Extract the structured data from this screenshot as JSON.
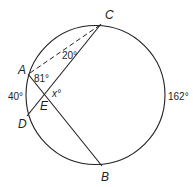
{
  "diagram": {
    "points": {
      "A": "A",
      "B": "B",
      "C": "C",
      "D": "D",
      "E": "E"
    },
    "angles": {
      "angle_A": "81°",
      "angle_C": "20°",
      "angle_E": "x°"
    },
    "arcs": {
      "arc_AD": "40°",
      "arc_CB": "162°"
    },
    "colors": {
      "stroke": "#231f20",
      "background": "#ffffff"
    }
  }
}
